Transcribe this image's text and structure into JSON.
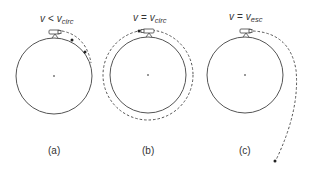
{
  "figure": {
    "panels": [
      {
        "id": "a",
        "caption": "(a)",
        "label_var": "v",
        "label_rel": "<",
        "label_sub_var": "v",
        "label_sub": "circ",
        "trajectory": "falls back to surface"
      },
      {
        "id": "b",
        "caption": "(b)",
        "label_var": "v",
        "label_rel": "=",
        "label_sub_var": "v",
        "label_sub": "circ",
        "trajectory": "circular orbit"
      },
      {
        "id": "c",
        "caption": "(c)",
        "label_var": "v",
        "label_rel": "=",
        "label_sub_var": "v",
        "label_sub": "esc",
        "trajectory": "escape trajectory"
      }
    ],
    "colors": {
      "line": "#555555",
      "text": "#333333",
      "background": "#ffffff"
    }
  }
}
